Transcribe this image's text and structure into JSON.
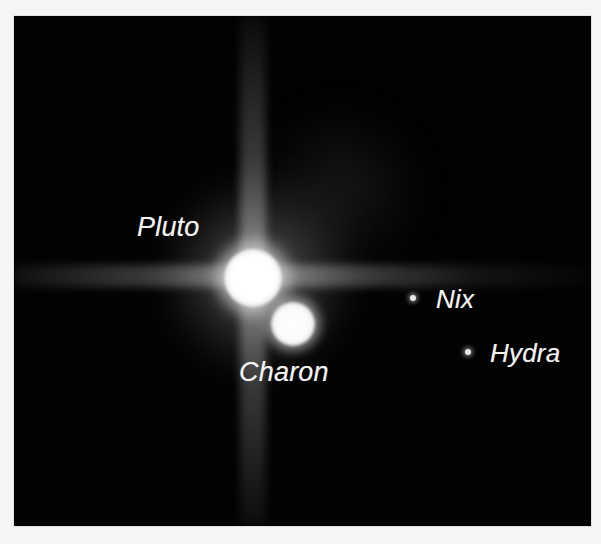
{
  "image": {
    "subject": "Pluto system",
    "background_color": "#f5f5f5",
    "frame_color": "#020202",
    "label_color": "#f2f2f2"
  },
  "bodies": [
    {
      "name": "Pluto",
      "label": "Pluto",
      "type": "dwarf-planet"
    },
    {
      "name": "Charon",
      "label": "Charon",
      "type": "moon"
    },
    {
      "name": "Nix",
      "label": "Nix",
      "type": "moon"
    },
    {
      "name": "Hydra",
      "label": "Hydra",
      "type": "moon"
    }
  ]
}
